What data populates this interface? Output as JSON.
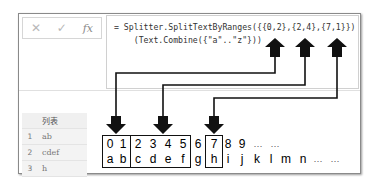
{
  "formula_bar": {
    "cancel_icon": "✕",
    "confirm_icon": "✓",
    "fx_icon": "fx",
    "formula_line1": "= Splitter.SplitTextByRanges({{0,2},{2,4},{7,1}})",
    "formula_line2": "    (Text.Combine({\"a\"..\"z\"}))"
  },
  "result_table": {
    "header": "列表",
    "rows": [
      {
        "index": "1",
        "value": "ab"
      },
      {
        "index": "2",
        "value": "cdef"
      },
      {
        "index": "3",
        "value": "h"
      }
    ]
  },
  "diagram": {
    "index_row": [
      "0",
      "1",
      "2",
      "3",
      "4",
      "5",
      "6",
      "7",
      "8",
      "9",
      "…",
      "…"
    ],
    "letter_row": [
      "a",
      "b",
      "c",
      "d",
      "e",
      "f",
      "g",
      "h",
      "i",
      "j",
      "k",
      "l",
      "m",
      "n",
      "…",
      "…"
    ],
    "ranges": [
      {
        "start": 0,
        "length": 2
      },
      {
        "start": 2,
        "length": 4
      },
      {
        "start": 7,
        "length": 1
      }
    ]
  }
}
